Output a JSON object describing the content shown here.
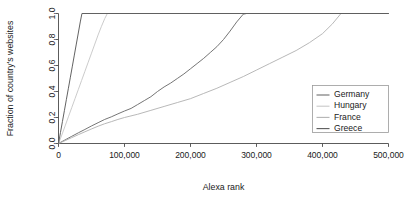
{
  "chart_data": {
    "type": "line",
    "title": "",
    "xlabel": "Alexa rank",
    "ylabel": "Fraction of country's websites",
    "xlim": [
      0,
      500000
    ],
    "ylim": [
      0.0,
      1.0
    ],
    "xticks": [
      0,
      100000,
      200000,
      300000,
      400000,
      500000
    ],
    "xticklabels": [
      "0",
      "100,000",
      "200,000",
      "300,000",
      "400,000",
      "500,000"
    ],
    "yticks": [
      0.0,
      0.2,
      0.4,
      0.6,
      0.8,
      1.0
    ],
    "yticklabels": [
      "0.0",
      "0.2",
      "0.4",
      "0.6",
      "0.8",
      "1.0"
    ],
    "grid": false,
    "legend_position": "right-inside",
    "series": [
      {
        "name": "Germany",
        "color": "#6e6e6e",
        "points": [
          [
            0,
            0.0
          ],
          [
            10000,
            0.028
          ],
          [
            20000,
            0.055
          ],
          [
            30000,
            0.082
          ],
          [
            40000,
            0.108
          ],
          [
            50000,
            0.135
          ],
          [
            60000,
            0.16
          ],
          [
            70000,
            0.185
          ],
          [
            80000,
            0.205
          ],
          [
            90000,
            0.228
          ],
          [
            100000,
            0.25
          ],
          [
            110000,
            0.27
          ],
          [
            120000,
            0.3
          ],
          [
            130000,
            0.33
          ],
          [
            140000,
            0.36
          ],
          [
            150000,
            0.4
          ],
          [
            160000,
            0.435
          ],
          [
            170000,
            0.465
          ],
          [
            180000,
            0.5
          ],
          [
            190000,
            0.535
          ],
          [
            200000,
            0.575
          ],
          [
            210000,
            0.615
          ],
          [
            220000,
            0.655
          ],
          [
            230000,
            0.7
          ],
          [
            240000,
            0.745
          ],
          [
            250000,
            0.8
          ],
          [
            260000,
            0.865
          ],
          [
            270000,
            0.935
          ],
          [
            280000,
            0.995
          ],
          [
            285000,
            1.0
          ],
          [
            500000,
            1.0
          ]
        ]
      },
      {
        "name": "Hungary",
        "color": "#c8c8c8",
        "points": [
          [
            0,
            0.0
          ],
          [
            5000,
            0.065
          ],
          [
            10000,
            0.135
          ],
          [
            15000,
            0.205
          ],
          [
            20000,
            0.275
          ],
          [
            25000,
            0.345
          ],
          [
            30000,
            0.415
          ],
          [
            35000,
            0.485
          ],
          [
            40000,
            0.555
          ],
          [
            45000,
            0.625
          ],
          [
            50000,
            0.695
          ],
          [
            55000,
            0.765
          ],
          [
            60000,
            0.835
          ],
          [
            65000,
            0.9
          ],
          [
            70000,
            0.96
          ],
          [
            74000,
            1.0
          ],
          [
            500000,
            1.0
          ]
        ]
      },
      {
        "name": "France",
        "color": "#b4b4b4",
        "points": [
          [
            0,
            0.0
          ],
          [
            10000,
            0.022
          ],
          [
            20000,
            0.045
          ],
          [
            30000,
            0.068
          ],
          [
            40000,
            0.09
          ],
          [
            50000,
            0.112
          ],
          [
            60000,
            0.133
          ],
          [
            70000,
            0.152
          ],
          [
            80000,
            0.168
          ],
          [
            90000,
            0.185
          ],
          [
            100000,
            0.2
          ],
          [
            120000,
            0.225
          ],
          [
            140000,
            0.255
          ],
          [
            160000,
            0.285
          ],
          [
            180000,
            0.315
          ],
          [
            200000,
            0.345
          ],
          [
            220000,
            0.385
          ],
          [
            240000,
            0.425
          ],
          [
            260000,
            0.47
          ],
          [
            280000,
            0.515
          ],
          [
            300000,
            0.565
          ],
          [
            320000,
            0.615
          ],
          [
            340000,
            0.665
          ],
          [
            360000,
            0.715
          ],
          [
            380000,
            0.775
          ],
          [
            400000,
            0.845
          ],
          [
            415000,
            0.92
          ],
          [
            428000,
            1.0
          ],
          [
            500000,
            1.0
          ]
        ]
      },
      {
        "name": "Greece",
        "color": "#5a5a5a",
        "points": [
          [
            0,
            0.0
          ],
          [
            3000,
            0.085
          ],
          [
            6000,
            0.17
          ],
          [
            9000,
            0.255
          ],
          [
            12000,
            0.34
          ],
          [
            15000,
            0.425
          ],
          [
            18000,
            0.51
          ],
          [
            21000,
            0.595
          ],
          [
            24000,
            0.68
          ],
          [
            27000,
            0.765
          ],
          [
            30000,
            0.85
          ],
          [
            33000,
            0.935
          ],
          [
            35500,
            1.0
          ],
          [
            500000,
            1.0
          ]
        ]
      }
    ]
  },
  "legend": {
    "entries": [
      {
        "label": "Germany",
        "color": "#6e6e6e"
      },
      {
        "label": "Hungary",
        "color": "#c8c8c8"
      },
      {
        "label": "France",
        "color": "#b4b4b4"
      },
      {
        "label": "Greece",
        "color": "#5a5a5a"
      }
    ]
  },
  "axes": {
    "x_title": "Alexa rank",
    "y_title": "Fraction of country's websites"
  }
}
